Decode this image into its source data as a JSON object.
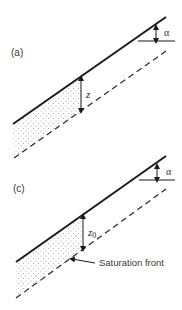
{
  "panels": [
    {
      "id": "a",
      "label": "(a)",
      "angle_label": "α",
      "depth_label": "z",
      "depth_subscript": "",
      "annotation": ""
    },
    {
      "id": "c",
      "label": "(c)",
      "angle_label": "α",
      "depth_label": "z",
      "depth_subscript": "0",
      "annotation": "Saturation front"
    }
  ],
  "colors": {
    "line": "#1a1a1a",
    "dashed": "#2a2a2a",
    "stipple": "#9a9a9a",
    "text": "#3a3a3a"
  }
}
